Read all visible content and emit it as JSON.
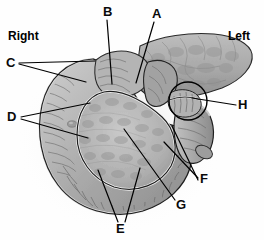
{
  "figure": {
    "type": "anatomical-illustration",
    "style": "grayscale medical illustration",
    "background_color": "#fefefe",
    "outline_color": "#1a1a1a",
    "tissue_fill": "#a8a8a8",
    "tissue_fill_light": "#c4c4c4",
    "tissue_fill_dark": "#8a8a8a"
  },
  "orientation": {
    "right_label": "Right",
    "left_label": "Left"
  },
  "labels": [
    {
      "id": "A",
      "text": "A",
      "x": 152,
      "y": 11,
      "leaders": 1
    },
    {
      "id": "B",
      "text": "B",
      "x": 104,
      "y": 9,
      "leaders": 1
    },
    {
      "id": "C",
      "text": "C",
      "x": 7,
      "y": 62,
      "leaders": 2
    },
    {
      "id": "D",
      "text": "D",
      "x": 8,
      "y": 117,
      "leaders": 2
    },
    {
      "id": "E",
      "text": "E",
      "x": 118,
      "y": 229,
      "leaders": 2
    },
    {
      "id": "F",
      "text": "F",
      "x": 201,
      "y": 179,
      "leaders": 2
    },
    {
      "id": "G",
      "text": "G",
      "x": 177,
      "y": 205,
      "leaders": 1
    },
    {
      "id": "H",
      "text": "H",
      "x": 240,
      "y": 105,
      "leaders": 1
    }
  ],
  "annotations": {
    "circle_highlight": {
      "cx": 188,
      "cy": 101,
      "r": 19
    }
  }
}
